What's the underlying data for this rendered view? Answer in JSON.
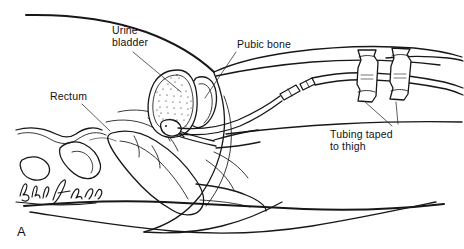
{
  "figure": {
    "panel_letter": "A",
    "background_color": "#ffffff",
    "ink_color": "#17171a",
    "artist_signature": "cursive-signature"
  },
  "labels": [
    {
      "id": "urine-bladder",
      "name": "urine-bladder-label",
      "line1": "Urine",
      "line2": "bladder",
      "x": 112,
      "y": 30,
      "leader_from": [
        133,
        52
      ],
      "leader_to": [
        181,
        92
      ]
    },
    {
      "id": "pubic-bone",
      "name": "pubic-bone-label",
      "line1": "Pubic bone",
      "line2": "",
      "x": 237,
      "y": 45,
      "leader_from": [
        236,
        52
      ],
      "leader_to": [
        205,
        98
      ]
    },
    {
      "id": "rectum",
      "name": "rectum-label",
      "line1": "Rectum",
      "line2": "",
      "x": 54,
      "y": 99,
      "leader_from": [
        82,
        104
      ],
      "leader_to": [
        110,
        131
      ]
    },
    {
      "id": "tubing-taped-to-thigh",
      "name": "tubing-taped-label",
      "line1": "Tubing taped",
      "line2": "to thigh",
      "x": 330,
      "y": 133,
      "leader_from": [
        364,
        100
      ],
      "leader_to": [
        392,
        126
      ]
    },
    {
      "id": "tubing-taped-to-thigh-second",
      "name": "tubing-taped-label-second-leader",
      "line1": "",
      "line2": "",
      "x": 0,
      "y": 0,
      "leader_from": [
        394,
        102
      ],
      "leader_to": [
        397,
        124
      ]
    }
  ],
  "anatomy_parts": [
    {
      "name": "abdominal-wall-contour"
    },
    {
      "name": "urine-bladder-organ"
    },
    {
      "name": "pubic-bone-organ"
    },
    {
      "name": "rectum-organ"
    },
    {
      "name": "perineum-contour"
    },
    {
      "name": "thigh-contour"
    },
    {
      "name": "sacrum-contour"
    }
  ],
  "device_parts": [
    {
      "name": "catheter-tube"
    },
    {
      "name": "catheter-connector"
    },
    {
      "name": "drainage-tubing"
    },
    {
      "name": "tape-strip-proximal"
    },
    {
      "name": "tape-strip-distal"
    }
  ]
}
